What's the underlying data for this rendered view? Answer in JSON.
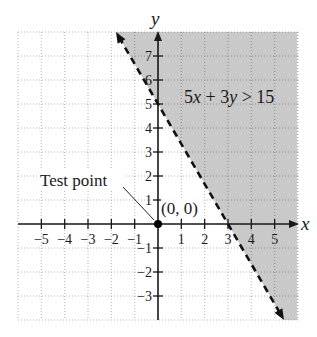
{
  "chart_data": {
    "type": "line",
    "title": "",
    "xlabel": "x",
    "ylabel": "y",
    "xlim": [
      -6,
      6
    ],
    "ylim": [
      -4,
      8
    ],
    "grid": true,
    "grid_style": "dotted",
    "x_ticks": [
      -5,
      -4,
      -3,
      -2,
      -1,
      1,
      2,
      3,
      4,
      5
    ],
    "y_ticks": [
      -3,
      -2,
      -1,
      1,
      2,
      3,
      4,
      5,
      6,
      7
    ],
    "x_tick_labels": [
      "−5",
      "−4",
      "−3",
      "−2",
      "−1",
      "1",
      "2",
      "3",
      "4",
      "5"
    ],
    "y_tick_labels": [
      "−3",
      "−2",
      "−1",
      "1",
      "2",
      "3",
      "4",
      "5",
      "6",
      "7"
    ],
    "boundary_line": {
      "equation": "5x + 3y = 15",
      "style": "dashed",
      "x_intercept": 3,
      "y_intercept": 5,
      "slope": -1.6667,
      "from": [
        -1.8,
        8
      ],
      "to": [
        5.4,
        -4
      ],
      "arrows": "both"
    },
    "shaded_region": {
      "inequality": "5x + 3y > 15",
      "side": "above-right of line",
      "color": "#c9c9c9"
    },
    "points": [
      {
        "label": "(0, 0)",
        "x": 0,
        "y": 0,
        "role": "test point"
      }
    ],
    "annotations": [
      {
        "text": "5x + 3y > 15",
        "x": 3.4,
        "y": 5.6
      },
      {
        "text": "Test point",
        "x": -4.7,
        "y": 2.0,
        "points_to": [
          0,
          0
        ]
      },
      {
        "text": "(0, 0)",
        "x": 0.15,
        "y": 0.45
      }
    ]
  },
  "labels": {
    "x_axis": "x",
    "y_axis": "y",
    "inequality_parts": [
      "5",
      "x",
      " + 3",
      "y",
      " > 15"
    ],
    "test_point": "Test point",
    "origin": "(0, 0)"
  },
  "colors": {
    "shade": "#c9c9c9",
    "grid_light": "#b5b5b5",
    "grid_dark": "#8f8f8f",
    "axis": "#1a1a1a",
    "line": "#111111"
  }
}
